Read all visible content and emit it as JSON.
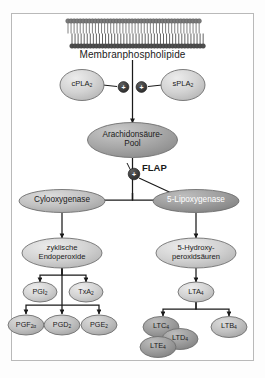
{
  "figure": {
    "membrane_label": "Membranphospholipide",
    "enzymes": {
      "cpla2": "cPLA",
      "cpla2_sub": "2",
      "spla2": "sPLA",
      "spla2_sub": "2"
    },
    "pool": {
      "line1": "Arachidonsäure-",
      "line2": "Pool"
    },
    "flap": "FLAP",
    "activation_symbol": "+",
    "branch_enzymes": {
      "cox": "Cylooxygenase",
      "lox": "5-Lipoxygenase"
    },
    "intermediates": {
      "left_line1": "zyklische",
      "left_line2": "Endoperoxide",
      "right_line1": "5-Hydroxy-",
      "right_line2": "peroxidsäuren"
    },
    "cox_products": [
      {
        "name": "PGI",
        "sub": "2"
      },
      {
        "name": "TxA",
        "sub": "2"
      }
    ],
    "prostaglandins": [
      {
        "name": "PGF",
        "sub": "2α"
      },
      {
        "name": "PGD",
        "sub": "2"
      },
      {
        "name": "PGE",
        "sub": "2"
      }
    ],
    "lox_products": {
      "lta4": {
        "name": "LTA",
        "sub": "4"
      },
      "cysteinyl": [
        {
          "name": "LTC",
          "sub": "4"
        },
        {
          "name": "LTD",
          "sub": "4"
        },
        {
          "name": "LTE",
          "sub": "4"
        }
      ],
      "ltb4": {
        "name": "LTB",
        "sub": "4"
      }
    },
    "colors": {
      "node_fill_light": "#cfcfcf",
      "node_fill_mid": "#b6b6b6",
      "node_fill_dark": "#8f8f8f",
      "node_stroke": "#6f6f6f",
      "arrow": "#1a1a1a",
      "membrane_head": "#6e6e6e",
      "frame": "#b9b9b9",
      "plus_circle": "#3a3a3a"
    }
  }
}
